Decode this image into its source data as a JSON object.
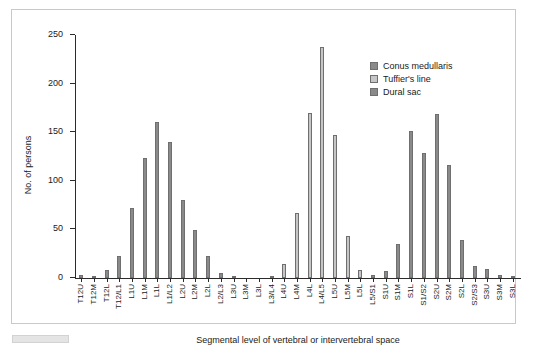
{
  "chart_data": {
    "type": "bar",
    "title": "",
    "xlabel": "Segmental level of vertebral or intervertebral space",
    "ylabel": "No. of persons",
    "ylim": [
      0,
      250
    ],
    "yticks": [
      0,
      50,
      100,
      150,
      200,
      250
    ],
    "grid": false,
    "legend_position": "upper-right",
    "categories": [
      "T12U",
      "T12M",
      "T12L",
      "T12/L1",
      "L1U",
      "L1M",
      "L1L",
      "L1/L2",
      "L2U",
      "L2M",
      "L2L",
      "L2/L3",
      "L3U",
      "L3M",
      "L3L",
      "L3/L4",
      "L4U",
      "L4M",
      "L4L",
      "L4/L5",
      "L5U",
      "L5M",
      "L5L",
      "L5/S1",
      "S1U",
      "S1M",
      "S1L",
      "S1/S2",
      "S2U",
      "S2M",
      "S2L",
      "S2/S3",
      "S3U",
      "S3M",
      "S3L"
    ],
    "series": [
      {
        "name": "Conus medullaris",
        "color": "#8a8a8a",
        "values": [
          3,
          2,
          8,
          23,
          72,
          123,
          161,
          140,
          80,
          49,
          23,
          5,
          2,
          0,
          0,
          0,
          0,
          0,
          0,
          0,
          0,
          0,
          0,
          0,
          0,
          0,
          0,
          0,
          0,
          0,
          0,
          0,
          0,
          0,
          0
        ]
      },
      {
        "name": "Tuffier's line",
        "color": "#c6c6c6",
        "values": [
          0,
          0,
          0,
          0,
          0,
          0,
          0,
          0,
          0,
          0,
          0,
          0,
          0,
          0,
          0,
          2,
          14,
          67,
          170,
          238,
          147,
          43,
          8,
          2,
          0,
          0,
          0,
          0,
          0,
          0,
          0,
          0,
          0,
          0,
          0
        ]
      },
      {
        "name": "Dural sac",
        "color": "#8a8a8a",
        "values": [
          0,
          0,
          0,
          0,
          0,
          0,
          0,
          0,
          0,
          0,
          0,
          0,
          0,
          0,
          0,
          0,
          0,
          0,
          0,
          0,
          0,
          0,
          0,
          3,
          7,
          35,
          151,
          129,
          169,
          116,
          39,
          12,
          9,
          3,
          1
        ]
      }
    ]
  },
  "legend": {
    "items": [
      {
        "label": "Conus medullaris",
        "color": "#8a8a8a"
      },
      {
        "label": "Tuffier's line",
        "color": "#c6c6c6"
      },
      {
        "label": "Dural sac",
        "color": "#8a8a8a"
      }
    ]
  }
}
